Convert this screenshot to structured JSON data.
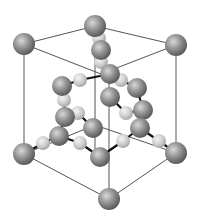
{
  "diagram": {
    "type": "crystal-unit-cell",
    "colors": {
      "background": "#ffffff",
      "cell_edge": "#555555",
      "bond": "#111111",
      "atom_dark_hi": "#d8d8d8",
      "atom_dark_mid": "#8f8f8f",
      "atom_dark_lo": "#5a5a5a",
      "atom_light_hi": "#f4f4f4",
      "atom_light_mid": "#cfcfcf",
      "atom_light_lo": "#a8a8a8"
    },
    "cell_edges": [
      [
        24,
        44,
        95,
        26
      ],
      [
        95,
        26,
        176,
        45
      ],
      [
        24,
        44,
        101,
        74
      ],
      [
        176,
        45,
        101,
        74
      ],
      [
        24,
        44,
        24,
        154
      ],
      [
        176,
        45,
        176,
        153
      ],
      [
        109,
        199,
        109,
        74
      ],
      [
        95,
        26,
        95,
        150
      ],
      [
        24,
        154,
        109,
        199
      ],
      [
        176,
        153,
        109,
        199
      ],
      [
        24,
        154,
        95,
        125
      ],
      [
        176,
        153,
        95,
        125
      ]
    ],
    "bonds": [
      [
        95,
        26,
        99,
        38
      ],
      [
        99,
        38,
        101,
        50
      ],
      [
        101,
        50,
        101,
        62
      ],
      [
        101,
        62,
        110,
        74
      ],
      [
        110,
        74,
        121,
        80
      ],
      [
        110,
        74,
        80,
        80
      ],
      [
        80,
        80,
        62,
        86
      ],
      [
        121,
        80,
        137,
        88
      ],
      [
        62,
        86,
        64,
        100
      ],
      [
        64,
        100,
        65,
        117
      ],
      [
        65,
        117,
        78,
        113
      ],
      [
        78,
        113,
        93,
        128
      ],
      [
        65,
        117,
        59,
        136
      ],
      [
        59,
        136,
        43,
        143
      ],
      [
        43,
        143,
        24,
        154
      ],
      [
        59,
        136,
        80,
        143
      ],
      [
        80,
        143,
        100,
        157
      ],
      [
        100,
        157,
        123,
        141
      ],
      [
        123,
        141,
        140,
        128
      ],
      [
        140,
        128,
        159,
        141
      ],
      [
        159,
        141,
        176,
        153
      ],
      [
        137,
        88,
        143,
        110
      ],
      [
        143,
        110,
        140,
        128
      ],
      [
        143,
        110,
        126,
        113
      ],
      [
        126,
        113,
        110,
        97
      ]
    ],
    "atoms_dark": [
      {
        "x": 95,
        "y": 26,
        "r": 11
      },
      {
        "x": 24,
        "y": 44,
        "r": 11
      },
      {
        "x": 176,
        "y": 45,
        "r": 11
      },
      {
        "x": 101,
        "y": 50,
        "r": 10
      },
      {
        "x": 62,
        "y": 86,
        "r": 10
      },
      {
        "x": 110,
        "y": 74,
        "r": 10
      },
      {
        "x": 137,
        "y": 88,
        "r": 10
      },
      {
        "x": 65,
        "y": 117,
        "r": 10
      },
      {
        "x": 93,
        "y": 128,
        "r": 10
      },
      {
        "x": 143,
        "y": 110,
        "r": 10
      },
      {
        "x": 59,
        "y": 136,
        "r": 10
      },
      {
        "x": 140,
        "y": 128,
        "r": 10
      },
      {
        "x": 110,
        "y": 97,
        "r": 10
      },
      {
        "x": 24,
        "y": 154,
        "r": 11
      },
      {
        "x": 100,
        "y": 157,
        "r": 10
      },
      {
        "x": 176,
        "y": 153,
        "r": 11
      },
      {
        "x": 109,
        "y": 199,
        "r": 11
      }
    ],
    "atoms_light": [
      {
        "x": 99,
        "y": 38,
        "r": 7
      },
      {
        "x": 101,
        "y": 62,
        "r": 7
      },
      {
        "x": 80,
        "y": 80,
        "r": 7
      },
      {
        "x": 121,
        "y": 80,
        "r": 7
      },
      {
        "x": 64,
        "y": 100,
        "r": 7
      },
      {
        "x": 78,
        "y": 113,
        "r": 7
      },
      {
        "x": 126,
        "y": 113,
        "r": 7
      },
      {
        "x": 43,
        "y": 143,
        "r": 7
      },
      {
        "x": 80,
        "y": 143,
        "r": 7
      },
      {
        "x": 123,
        "y": 141,
        "r": 7
      },
      {
        "x": 159,
        "y": 141,
        "r": 7
      }
    ]
  }
}
